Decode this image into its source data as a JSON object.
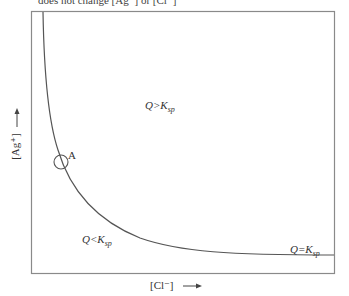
{
  "caption": "does not change [Ag⁺] or [Cl⁻]",
  "diagram": {
    "x_axis_label": "[Cl⁻]",
    "x_axis_arrow": "→",
    "y_axis_label": "[Ag⁺]",
    "y_axis_arrow": "→",
    "point_label": "A",
    "regions": {
      "above": {
        "q": "Q>K",
        "sub": "sp"
      },
      "below": {
        "q": "Q<K",
        "sub": "sp"
      },
      "on_curve": {
        "q": "Q=K",
        "sub": "sp"
      }
    },
    "colors": {
      "frame": "#888888",
      "curve": "#555555"
    }
  }
}
